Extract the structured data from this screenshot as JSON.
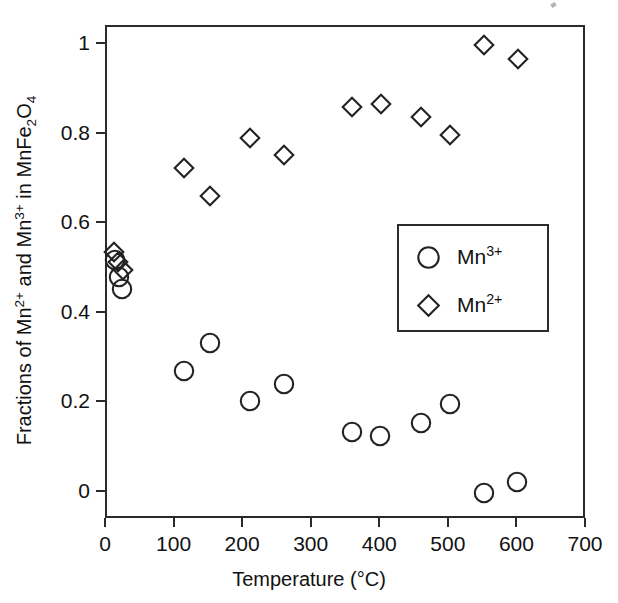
{
  "chart_data": {
    "type": "scatter",
    "title": "",
    "xlabel": "Temperature (°C)",
    "ylabel_plain": "Fractions of Mn2+ and Mn3+ in MnFe2O4",
    "xlim": [
      0,
      700
    ],
    "ylim": [
      -0.06,
      1.04
    ],
    "xticks": [
      0,
      100,
      200,
      300,
      400,
      500,
      600,
      700
    ],
    "xticklabels": [
      "0",
      "100",
      "200",
      "300",
      "400",
      "500",
      "600",
      "700"
    ],
    "yticks": [
      0,
      0.2,
      0.4,
      0.6,
      0.8,
      1
    ],
    "yticklabels": [
      "0",
      "0.2",
      "0.4",
      "0.6",
      "0.8",
      "1"
    ],
    "grid": false,
    "legend_position": "center-right",
    "series": [
      {
        "name": "Mn3+",
        "marker": "circle",
        "points": [
          {
            "x": 12,
            "y": 0.52
          },
          {
            "x": 18,
            "y": 0.482
          },
          {
            "x": 22,
            "y": 0.455
          },
          {
            "x": 112,
            "y": 0.272
          },
          {
            "x": 150,
            "y": 0.334
          },
          {
            "x": 208,
            "y": 0.206
          },
          {
            "x": 258,
            "y": 0.243
          },
          {
            "x": 358,
            "y": 0.136
          },
          {
            "x": 398,
            "y": 0.128
          },
          {
            "x": 458,
            "y": 0.156
          },
          {
            "x": 500,
            "y": 0.199
          },
          {
            "x": 550,
            "y": 0.0
          },
          {
            "x": 598,
            "y": 0.024
          }
        ]
      },
      {
        "name": "Mn2+",
        "marker": "diamond",
        "points": [
          {
            "x": 10,
            "y": 0.538
          },
          {
            "x": 16,
            "y": 0.515
          },
          {
            "x": 24,
            "y": 0.497
          },
          {
            "x": 112,
            "y": 0.726
          },
          {
            "x": 150,
            "y": 0.662
          },
          {
            "x": 208,
            "y": 0.792
          },
          {
            "x": 258,
            "y": 0.755
          },
          {
            "x": 358,
            "y": 0.862
          },
          {
            "x": 400,
            "y": 0.869
          },
          {
            "x": 458,
            "y": 0.84
          },
          {
            "x": 500,
            "y": 0.798
          },
          {
            "x": 550,
            "y": 0.999
          },
          {
            "x": 600,
            "y": 0.969
          }
        ]
      }
    ]
  },
  "legend": {
    "entries": [
      {
        "label_base": "Mn",
        "label_sup": "3+",
        "marker": "circle"
      },
      {
        "label_base": "Mn",
        "label_sup": "2+",
        "marker": "diamond"
      }
    ]
  },
  "ylabel_parts": {
    "p1": "Fractions of Mn",
    "sup1": "2+",
    "p2": " and Mn",
    "sup2": "3+",
    "p3": " in MnFe",
    "sub1": "2",
    "p4": "O",
    "sub2": "4"
  },
  "colors": {
    "marker_stroke": "#232323",
    "frame": "#2b2b2b",
    "text": "#111111",
    "background": "#ffffff"
  }
}
